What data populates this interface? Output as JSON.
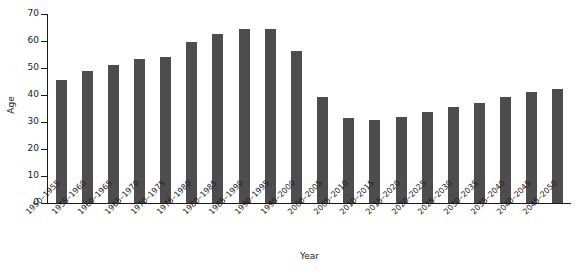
{
  "chart_data": {
    "type": "bar",
    "title": "",
    "subtitle": "",
    "xlabel": "Year",
    "ylabel": "Age",
    "ylim": [
      0,
      70
    ],
    "yticks": [
      0,
      10,
      20,
      30,
      40,
      50,
      60,
      70
    ],
    "grid": false,
    "legend": "none",
    "bar_color": "#4d4d4d",
    "axis_color": "#1a1a1a",
    "background": "#ffffff",
    "categories": [
      "1950–1955",
      "1955–1960",
      "1960–1965",
      "1965–1970",
      "1970–1975",
      "1975–1980",
      "1980–1985",
      "1985–1990",
      "1990–1995",
      "1995–2000",
      "2000–2005",
      "2005–2010",
      "2010–2015",
      "2015–2020",
      "2020–2025",
      "2025–2030",
      "2030–2035",
      "2035–2040",
      "2040–2045",
      "2045–2050"
    ],
    "values": [
      45.7,
      48.8,
      51.2,
      53.5,
      54.2,
      59.8,
      62.5,
      64.5,
      64.6,
      56.2,
      39.1,
      31.4,
      30.7,
      31.8,
      33.7,
      35.7,
      37.2,
      39.4,
      41.0,
      42.4
    ]
  }
}
